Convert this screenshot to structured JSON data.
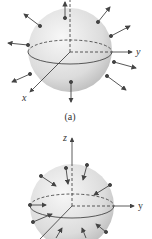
{
  "figure_a": {
    "caption": "(a)",
    "axes": {
      "x": "x",
      "y": "y",
      "z": "z"
    },
    "field_direction": "outward"
  },
  "figure_b": {
    "caption": "(b)",
    "axes": {
      "x": "x",
      "y": "y",
      "z": "z"
    },
    "field_direction": "inward"
  },
  "colors": {
    "sphere_light": "#f2f2f2",
    "sphere_dark": "#c8c8c8",
    "line": "#333333",
    "dot": "#444444"
  }
}
